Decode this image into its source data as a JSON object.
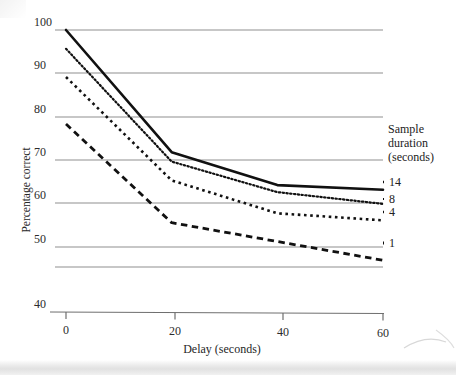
{
  "chart_data": {
    "type": "line",
    "title": "",
    "xlabel": "Delay (seconds)",
    "ylabel": "Percentage correct",
    "x": [
      0,
      20,
      40,
      60
    ],
    "xticks": [
      "0",
      "20",
      "40",
      "60"
    ],
    "yticks": [
      "100",
      "90",
      "80",
      "70",
      "60",
      "50",
      "40"
    ],
    "xlim": [
      0,
      60
    ],
    "ylim": [
      40,
      100
    ],
    "grid": true,
    "legend_position": "right",
    "legend_title": [
      "Sample",
      "duration",
      "(seconds)"
    ],
    "series": [
      {
        "name": "14",
        "style": "solid",
        "values": [
          100,
          74,
          67,
          66
        ]
      },
      {
        "name": "8",
        "style": "dotted",
        "values": [
          96,
          72,
          65.5,
          63
        ]
      },
      {
        "name": "4",
        "style": "dashed-small",
        "values": [
          90,
          68,
          61,
          59.5
        ]
      },
      {
        "name": "1",
        "style": "dashed-large",
        "values": [
          80,
          59,
          55,
          51
        ]
      }
    ]
  },
  "axes": {
    "y_title": "Percentage correct",
    "x_title": "Delay (seconds)",
    "y_tick_labels": [
      "100",
      "90",
      "80",
      "70",
      "60",
      "50",
      "40"
    ],
    "x_tick_labels": [
      "0",
      "20",
      "40",
      "60"
    ]
  },
  "legend": {
    "title_line1": "Sample",
    "title_line2": "duration",
    "title_line3": "(seconds)",
    "entries": [
      {
        "label": "14"
      },
      {
        "label": "8"
      },
      {
        "label": "4"
      },
      {
        "label": "1"
      }
    ]
  },
  "colors": {
    "ink": "#1a1a1a",
    "gridline": "#8f8f8f",
    "axis": "#6f6f6f",
    "background": "#ffffff",
    "scan_band": "#e2e2e2"
  }
}
